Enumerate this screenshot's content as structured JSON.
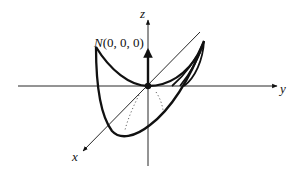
{
  "diagram": {
    "type": "3d-coordinate-surface-sketch",
    "axes": {
      "x": {
        "label": "x"
      },
      "y": {
        "label": "y"
      },
      "z": {
        "label": "z"
      }
    },
    "point": {
      "label_name": "N",
      "label_coords": "(0, 0, 0)"
    },
    "colors": {
      "stroke": "#111111",
      "background": "#ffffff"
    }
  }
}
